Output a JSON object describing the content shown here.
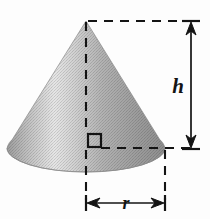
{
  "figure": {
    "kind": "geometry-diagram",
    "background_color": "#fdfdfd",
    "ink_color": "#141414",
    "canvas": {
      "width": 210,
      "height": 219
    }
  },
  "labels": {
    "height": "h",
    "radius": "r"
  },
  "shape": {
    "name": "cone-body",
    "apex": {
      "x": 86,
      "y": 21
    },
    "base_center": {
      "x": 86,
      "y": 148
    },
    "base_rx": 79,
    "base_ry": 24,
    "shading": {
      "type": "linear-gradient-horizontal",
      "description": "dark left rim, light highlight left-of-center, darkening toward right",
      "stops": [
        {
          "offset": "0%",
          "color": "#9c9c9c"
        },
        {
          "offset": "12%",
          "color": "#bdbdbd"
        },
        {
          "offset": "30%",
          "color": "#e3e3e3"
        },
        {
          "offset": "42%",
          "color": "#d2d2d2"
        },
        {
          "offset": "60%",
          "color": "#b2b2b2"
        },
        {
          "offset": "80%",
          "color": "#9e9e9e"
        },
        {
          "offset": "100%",
          "color": "#8f8f8f"
        }
      ]
    }
  },
  "annotations": {
    "axis_line": {
      "name": "height-axis-dashed",
      "from": {
        "x": 86,
        "y": 22
      },
      "to": {
        "x": 86,
        "y": 147
      },
      "style": "dashed"
    },
    "top_extension": {
      "name": "apex-extension-dashed",
      "from": {
        "x": 88,
        "y": 21
      },
      "to": {
        "x": 197,
        "y": 21
      },
      "style": "dashed"
    },
    "radius_line": {
      "name": "radius-dashed",
      "from": {
        "x": 101,
        "y": 148
      },
      "to": {
        "x": 197,
        "y": 148
      },
      "style": "dashed"
    },
    "right_angle_marker": {
      "name": "right-angle-square",
      "x": 88,
      "y": 134,
      "size": 13
    },
    "height_dimension": {
      "name": "height-dimension-line",
      "x": 191,
      "y_top": 21,
      "y_bottom": 149,
      "arrows": "both",
      "caps": "tick"
    },
    "radius_dimension": {
      "name": "radius-dimension-line",
      "y": 203,
      "x_left": 86,
      "x_right": 165,
      "arrows": "both",
      "caps": "tick"
    },
    "droppers": [
      {
        "name": "center-dropper-dashed",
        "x": 86,
        "y_from": 150,
        "y_to": 200
      },
      {
        "name": "edge-dropper-dashed",
        "x": 165,
        "y_from": 150,
        "y_to": 200
      }
    ]
  }
}
